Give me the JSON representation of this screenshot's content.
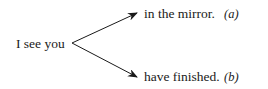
{
  "diagram": {
    "source": "I see you",
    "branches": [
      {
        "text": "in the mirror.",
        "label": "(a)"
      },
      {
        "text": "have finished.",
        "label": "(b)"
      }
    ]
  }
}
